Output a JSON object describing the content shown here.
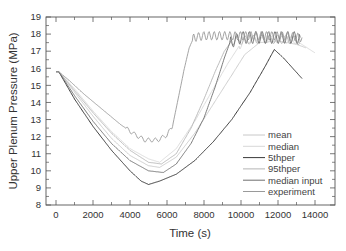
{
  "chart_data": {
    "type": "line",
    "title": "",
    "xlabel": "Time (s)",
    "ylabel": "Upper Plenum Pressure (MPa)",
    "xlim": [
      -800,
      15000
    ],
    "ylim": [
      8,
      19
    ],
    "xticks": [
      0,
      2000,
      4000,
      6000,
      8000,
      10000,
      12000,
      14000
    ],
    "xtick_labels": [
      "0",
      "2000",
      "4000",
      "6000",
      "8000",
      "10000",
      "12000",
      "14000"
    ],
    "yticks": [
      8,
      9,
      10,
      11,
      12,
      13,
      14,
      15,
      16,
      17,
      18,
      19
    ],
    "ytick_labels": [
      "8",
      "9",
      "10",
      "11",
      "12",
      "13",
      "14",
      "15",
      "16",
      "17",
      "18",
      "19"
    ],
    "grid": false,
    "legend_position": "lower right",
    "series": [
      {
        "name": "mean",
        "color": "#c8c8c8",
        "width": 0.9,
        "points": [
          [
            0,
            15.8
          ],
          [
            150,
            15.8
          ],
          [
            1000,
            14.6
          ],
          [
            2000,
            13.2
          ],
          [
            3000,
            11.9
          ],
          [
            4000,
            10.9
          ],
          [
            5000,
            10.3
          ],
          [
            5600,
            10.2
          ],
          [
            6500,
            10.8
          ],
          [
            7500,
            12.2
          ],
          [
            8500,
            13.9
          ],
          [
            9500,
            15.6
          ],
          [
            10200,
            16.8
          ],
          [
            11000,
            17.5
          ],
          [
            12000,
            17.6
          ],
          [
            13000,
            17.4
          ],
          [
            13500,
            17.2
          ]
        ]
      },
      {
        "name": "median",
        "color": "#d8d8d8",
        "width": 0.9,
        "points": [
          [
            0,
            15.8
          ],
          [
            150,
            15.8
          ],
          [
            1000,
            14.8
          ],
          [
            2000,
            13.5
          ],
          [
            3000,
            12.3
          ],
          [
            4000,
            11.3
          ],
          [
            5000,
            10.7
          ],
          [
            5600,
            10.5
          ],
          [
            6500,
            11.3
          ],
          [
            7500,
            12.9
          ],
          [
            8500,
            14.8
          ],
          [
            9300,
            16.3
          ],
          [
            9900,
            17.3
          ],
          [
            10500,
            17.7
          ],
          [
            12000,
            17.7
          ],
          [
            13000,
            17.6
          ],
          [
            14000,
            16.9
          ]
        ]
      },
      {
        "name": "5thper",
        "color": "#3a3a3a",
        "width": 1.0,
        "points": [
          [
            0,
            15.8
          ],
          [
            150,
            15.8
          ],
          [
            1000,
            14.2
          ],
          [
            2000,
            12.6
          ],
          [
            3000,
            11.2
          ],
          [
            4000,
            10.0
          ],
          [
            4600,
            9.4
          ],
          [
            5000,
            9.2
          ],
          [
            5600,
            9.4
          ],
          [
            6500,
            9.8
          ],
          [
            7500,
            10.6
          ],
          [
            8500,
            11.7
          ],
          [
            9500,
            13.0
          ],
          [
            10500,
            14.6
          ],
          [
            11300,
            16.1
          ],
          [
            11800,
            17.1
          ],
          [
            12300,
            16.6
          ],
          [
            12800,
            16.0
          ],
          [
            13300,
            15.4
          ]
        ]
      },
      {
        "name": "95thper",
        "color": "#b4b4b4",
        "width": 0.9,
        "points": [
          [
            0,
            15.8
          ],
          [
            150,
            15.8
          ],
          [
            1000,
            14.7
          ],
          [
            2000,
            13.4
          ],
          [
            3000,
            12.2
          ],
          [
            4000,
            11.2
          ],
          [
            5000,
            10.5
          ],
          [
            5700,
            10.4
          ],
          [
            6500,
            11.0
          ],
          [
            7300,
            12.5
          ],
          [
            8000,
            14.2
          ],
          [
            8600,
            15.8
          ],
          [
            9100,
            17.0
          ],
          [
            9500,
            17.6
          ],
          [
            11000,
            17.7
          ],
          [
            12500,
            17.7
          ],
          [
            13200,
            17.6
          ]
        ]
      },
      {
        "name": "median input",
        "color": "#6e6e6e",
        "width": 0.9,
        "points": [
          [
            0,
            15.8
          ],
          [
            150,
            15.8
          ],
          [
            1000,
            14.4
          ],
          [
            2000,
            12.9
          ],
          [
            3000,
            11.6
          ],
          [
            4000,
            10.6
          ],
          [
            5000,
            10.0
          ],
          [
            5800,
            9.9
          ],
          [
            6500,
            10.4
          ],
          [
            7300,
            11.6
          ],
          [
            8000,
            13.1
          ],
          [
            8600,
            14.9
          ],
          [
            9100,
            16.6
          ],
          [
            9400,
            17.5
          ],
          [
            10000,
            17.8
          ],
          [
            11500,
            17.8
          ],
          [
            13200,
            17.8
          ]
        ]
      },
      {
        "name": "experiment",
        "color": "#9a9a9a",
        "width": 0.9,
        "points": [
          [
            0,
            15.8
          ],
          [
            150,
            15.8
          ],
          [
            700,
            15.3
          ],
          [
            1500,
            14.5
          ],
          [
            2500,
            13.6
          ],
          [
            3500,
            12.7
          ],
          [
            4300,
            12.1
          ],
          [
            4800,
            11.8
          ],
          [
            5500,
            11.8
          ],
          [
            6000,
            12.1
          ],
          [
            6300,
            12.6
          ],
          [
            6600,
            14.2
          ],
          [
            6900,
            15.8
          ],
          [
            7200,
            17.2
          ],
          [
            7450,
            17.8
          ],
          [
            8000,
            17.9
          ],
          [
            9000,
            17.9
          ],
          [
            10500,
            17.9
          ],
          [
            12000,
            17.9
          ],
          [
            13300,
            17.8
          ]
        ]
      }
    ]
  },
  "legend": {
    "items": [
      {
        "label": "mean",
        "color": "#c8c8c8"
      },
      {
        "label": "median",
        "color": "#d8d8d8"
      },
      {
        "label": "5thper",
        "color": "#3a3a3a"
      },
      {
        "label": "95thper",
        "color": "#b4b4b4"
      },
      {
        "label": "median input",
        "color": "#6e6e6e"
      },
      {
        "label": "experiment",
        "color": "#9a9a9a"
      }
    ]
  }
}
